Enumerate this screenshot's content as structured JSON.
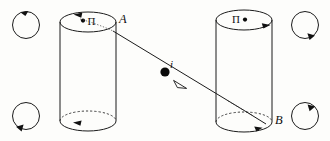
{
  "figure": {
    "background_color": "#fdfdfb",
    "ink_color": "#111111",
    "width": 330,
    "height": 141
  },
  "cylinders": [
    {
      "id": "left",
      "name": "cylinder-left",
      "top_label": "•Π",
      "top_label_parts": {
        "dot": "•",
        "pi": "Π"
      },
      "corner_label": "A",
      "corner_label_position": "top-right",
      "circulation": "counter-clockwise",
      "top_arrow_direction": "left",
      "bottom_arrow_direction": "left",
      "left_x": 60,
      "right_x": 116,
      "top_y": 22,
      "bottom_y": 121,
      "ellipse_ry": 10
    },
    {
      "id": "right",
      "name": "cylinder-right",
      "top_label": "Π•",
      "top_label_parts": {
        "pi": "Π",
        "dot": "•"
      },
      "corner_label": "B",
      "corner_label_position": "bottom-right",
      "circulation": "clockwise",
      "top_arrow_direction": "right",
      "bottom_arrow_direction": "right",
      "left_x": 216,
      "right_x": 272,
      "top_y": 20,
      "bottom_y": 122,
      "ellipse_ry": 10
    }
  ],
  "inclined_line": {
    "name": "current-line",
    "label": "i",
    "label_meaning": "current",
    "start_x": 113,
    "start_y": 31,
    "end_x": 266,
    "end_y": 124,
    "direction_arrow": "down-right",
    "arrowhead_style": "hollow",
    "marker_dot": {
      "x": 165,
      "y": 72,
      "r": 4.6,
      "style": "filled"
    },
    "arrowhead": {
      "x": 181,
      "y": 83
    }
  },
  "corner_circles": [
    {
      "id": "top-left",
      "name": "circulation-arrow-top-left",
      "cx": 26,
      "cy": 25,
      "r": 14,
      "arrow_position": "top",
      "rotation": "counter-clockwise"
    },
    {
      "id": "top-right",
      "name": "circulation-arrow-top-right",
      "cx": 305,
      "cy": 25,
      "r": 14,
      "arrow_position": "bottom-right",
      "rotation": "clockwise"
    },
    {
      "id": "bottom-left",
      "name": "circulation-arrow-bottom-left",
      "cx": 26,
      "cy": 116,
      "r": 14,
      "arrow_position": "bottom-left",
      "rotation": "clockwise"
    },
    {
      "id": "bottom-right",
      "name": "circulation-arrow-bottom-right",
      "cx": 305,
      "cy": 116,
      "r": 14,
      "arrow_position": "top-right",
      "rotation": "clockwise"
    }
  ]
}
